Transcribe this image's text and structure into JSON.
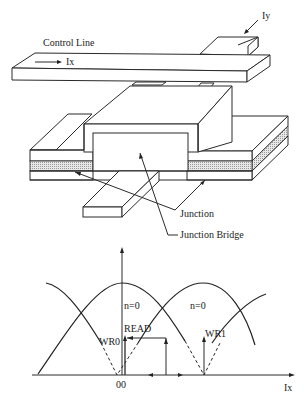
{
  "device": {
    "control_line_label": "Control Line",
    "ix_label": "Ix",
    "iy_label": "Iy",
    "junction_label": "Junction",
    "junction_bridge_label": "Junction Bridge"
  },
  "graph": {
    "region_label_left": "n=0",
    "region_label_right": "n=0",
    "read_label": "READ",
    "wr0_label": "WR0",
    "wr1_label": "WR1",
    "origin_label": "00",
    "x_axis_label": "Ix"
  },
  "colors": {
    "ink": "#222222",
    "background": "#ffffff"
  }
}
